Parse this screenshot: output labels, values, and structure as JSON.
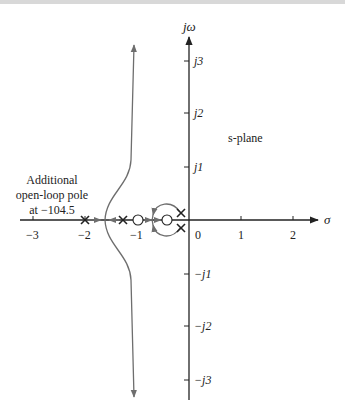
{
  "diagram": {
    "type": "root-locus",
    "plane_label": "s-plane",
    "axes": {
      "imag_label": "jω",
      "real_label": "σ",
      "real_ticks": [
        "−3",
        "−2",
        "−1",
        "0",
        "1",
        "2"
      ],
      "imag_ticks_positive": [
        "j1",
        "j2",
        "j3"
      ],
      "imag_ticks_negative": [
        "−j1",
        "−j2",
        "−j3"
      ]
    },
    "annotation": {
      "line1": "Additional",
      "line2": "open-loop pole",
      "line3": "at −104.5"
    },
    "open_loop_poles": [
      {
        "real": -2.0,
        "imag": 0
      },
      {
        "real": -1.3,
        "imag": 0
      },
      {
        "real": -0.35,
        "imag": 0.15
      },
      {
        "real": -0.35,
        "imag": -0.15
      },
      {
        "real": -104.5,
        "imag": 0,
        "note": "off-chart"
      }
    ],
    "open_loop_zeros": [
      {
        "real": -1.0,
        "imag": 0
      },
      {
        "real": -0.6,
        "imag": 0
      }
    ],
    "colors": {
      "axis": "#222222",
      "locus": "#6e6e6e",
      "background": "#ffffff"
    }
  }
}
